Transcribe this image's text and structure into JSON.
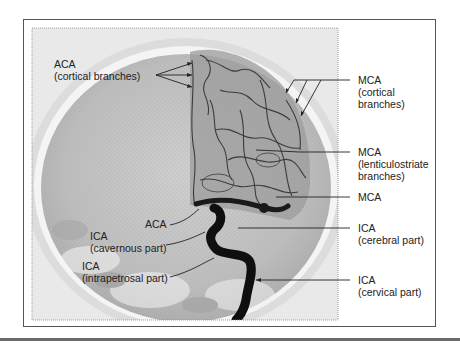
{
  "figure": {
    "frame_color": "#555555",
    "background": "#ffffff"
  },
  "labels": {
    "aca_cortical": {
      "line1": "ACA",
      "line2": "(cortical branches)"
    },
    "mca_cortical": {
      "line1": "MCA",
      "line2": "(cortical",
      "line3": "branches)"
    },
    "mca_lenticulostriate": {
      "line1": "MCA",
      "line2": "(lenticulostriate",
      "line3": "branches)"
    },
    "mca": {
      "line1": "MCA"
    },
    "ica_cerebral": {
      "line1": "ICA",
      "line2": "(cerebral part)"
    },
    "ica_cervical": {
      "line1": "ICA",
      "line2": "(cervical part)"
    },
    "aca": {
      "line1": "ACA"
    },
    "ica_cavernous": {
      "line1": "ICA",
      "line2": "(cavernous part)"
    },
    "ica_intrapetrosal": {
      "line1": "ICA",
      "line2": "(intrapetrosal part)"
    }
  }
}
